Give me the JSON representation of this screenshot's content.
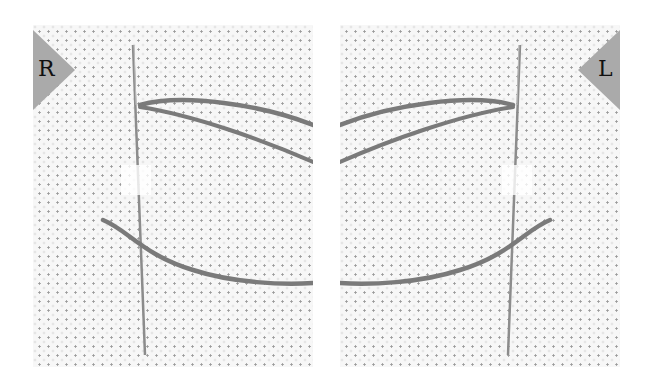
{
  "figure": {
    "panels": [
      {
        "id": "right-hand",
        "label": "R",
        "tab_side": "left"
      },
      {
        "id": "left-hand",
        "label": "L",
        "tab_side": "right"
      }
    ],
    "colors": {
      "fabric": "#f7f7f7",
      "fabric_holes": "#9a9a9a",
      "thread": "#7a7a7a",
      "needle": "#8c8c8c",
      "tab": "#aaaaaa",
      "label_text": "#111111"
    }
  }
}
